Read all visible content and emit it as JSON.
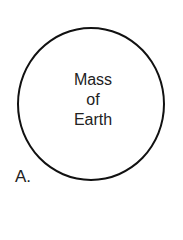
{
  "diagram": {
    "circle_label_lines": [
      "Mass",
      "of",
      "Earth"
    ],
    "option_letter": "A.",
    "stroke_color": "#111111"
  }
}
